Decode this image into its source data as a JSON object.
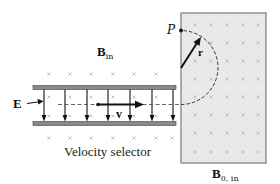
{
  "labels": {
    "b_in": {
      "main": "B",
      "sub": "in"
    },
    "b0_in": {
      "main": "B",
      "sub": "0, in"
    },
    "e_field": "E",
    "velocity": "v",
    "point_p": "P",
    "radius": "r",
    "caption": "Velocity selector"
  },
  "colors": {
    "ink": "#111111",
    "plate_fill": "#8a8a8a",
    "box_fill": "#e9e9e9",
    "box_stroke": "#7a7a7a",
    "x_mark": "#b0b0b0"
  },
  "field_line_x": [
    44,
    65,
    87,
    108,
    130,
    152,
    173
  ]
}
